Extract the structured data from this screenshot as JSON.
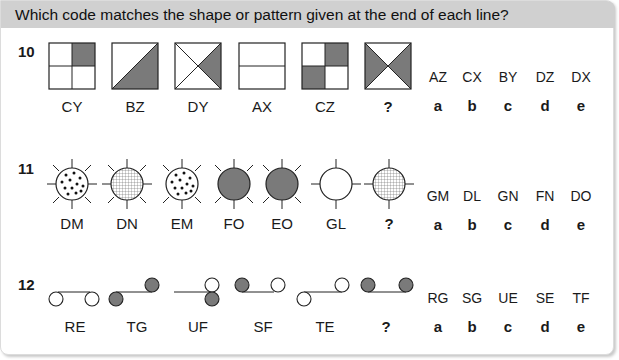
{
  "header": {
    "instruction": "Which code matches the shape or pattern given at the end of each line?"
  },
  "colors": {
    "header_bg": "#d0d0d0",
    "fill_grey": "#7a7a7a",
    "line": "#222222"
  },
  "questions": [
    {
      "number": "10",
      "figure_labels": [
        "CY",
        "BZ",
        "DY",
        "AX",
        "CZ",
        "?"
      ],
      "options": [
        {
          "code": "AZ",
          "letter": "a"
        },
        {
          "code": "CX",
          "letter": "b"
        },
        {
          "code": "BY",
          "letter": "c"
        },
        {
          "code": "DZ",
          "letter": "d"
        },
        {
          "code": "DX",
          "letter": "e"
        }
      ]
    },
    {
      "number": "11",
      "figure_labels": [
        "DM",
        "DN",
        "EM",
        "FO",
        "EO",
        "GL",
        "?"
      ],
      "options": [
        {
          "code": "GM",
          "letter": "a"
        },
        {
          "code": "DL",
          "letter": "b"
        },
        {
          "code": "GN",
          "letter": "c"
        },
        {
          "code": "FN",
          "letter": "d"
        },
        {
          "code": "DO",
          "letter": "e"
        }
      ]
    },
    {
      "number": "12",
      "figure_labels": [
        "RE",
        "TG",
        "UF",
        "SF",
        "TE",
        "?"
      ],
      "options": [
        {
          "code": "RG",
          "letter": "a"
        },
        {
          "code": "SG",
          "letter": "b"
        },
        {
          "code": "UE",
          "letter": "c"
        },
        {
          "code": "SE",
          "letter": "d"
        },
        {
          "code": "TF",
          "letter": "e"
        }
      ]
    }
  ]
}
